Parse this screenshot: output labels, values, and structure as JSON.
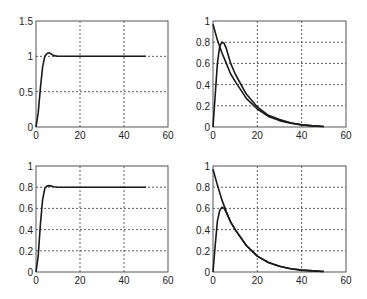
{
  "chart_data": [
    {
      "type": "line",
      "title": "",
      "xlabel": "",
      "ylabel": "",
      "xlim": [
        0,
        60
      ],
      "ylim": [
        0,
        1.5
      ],
      "xticks": [
        "0",
        "20",
        "40",
        "60"
      ],
      "yticks": [
        "0",
        "0.5",
        "1",
        "1.5"
      ],
      "grid": true,
      "series": [
        {
          "name": "response",
          "x": [
            0,
            1,
            2,
            3,
            4,
            5,
            6,
            7,
            8,
            10,
            15,
            20,
            30,
            40,
            50
          ],
          "values": [
            0,
            0.2,
            0.55,
            0.85,
            1.0,
            1.04,
            1.05,
            1.03,
            1.01,
            1.0,
            1.0,
            1.0,
            1.0,
            1.0,
            1.0
          ]
        }
      ]
    },
    {
      "type": "line",
      "title": "",
      "xlabel": "",
      "ylabel": "",
      "xlim": [
        0,
        60
      ],
      "ylim": [
        0,
        1
      ],
      "xticks": [
        "0",
        "20",
        "40",
        "60"
      ],
      "yticks": [
        "0",
        "0.2",
        "0.4",
        "0.6",
        "0.8",
        "1"
      ],
      "grid": true,
      "series": [
        {
          "name": "decay",
          "x": [
            0,
            2,
            4,
            6,
            8,
            10,
            15,
            20,
            25,
            30,
            35,
            40,
            45,
            50
          ],
          "values": [
            0.97,
            0.82,
            0.7,
            0.6,
            0.5,
            0.43,
            0.27,
            0.17,
            0.1,
            0.06,
            0.035,
            0.02,
            0.01,
            0.005
          ]
        },
        {
          "name": "rise-decay",
          "x": [
            0,
            1,
            2,
            3,
            4,
            5,
            6,
            8,
            10,
            15,
            20,
            25,
            30,
            35,
            40,
            45,
            50
          ],
          "values": [
            0,
            0.3,
            0.6,
            0.76,
            0.8,
            0.79,
            0.74,
            0.6,
            0.5,
            0.31,
            0.19,
            0.11,
            0.07,
            0.04,
            0.02,
            0.01,
            0.005
          ]
        }
      ]
    },
    {
      "type": "line",
      "title": "",
      "xlabel": "",
      "ylabel": "",
      "xlim": [
        0,
        60
      ],
      "ylim": [
        0,
        1
      ],
      "xticks": [
        "0",
        "20",
        "40",
        "60"
      ],
      "yticks": [
        "0",
        "0.2",
        "0.4",
        "0.6",
        "0.8",
        "1"
      ],
      "grid": true,
      "series": [
        {
          "name": "response",
          "x": [
            0,
            1,
            2,
            3,
            4,
            5,
            6,
            7,
            8,
            10,
            15,
            20,
            30,
            40,
            50
          ],
          "values": [
            0,
            0.15,
            0.45,
            0.68,
            0.79,
            0.81,
            0.815,
            0.81,
            0.805,
            0.8,
            0.8,
            0.8,
            0.8,
            0.8,
            0.8
          ]
        }
      ]
    },
    {
      "type": "line",
      "title": "",
      "xlabel": "",
      "ylabel": "",
      "xlim": [
        0,
        60
      ],
      "ylim": [
        0,
        1
      ],
      "xticks": [
        "0",
        "20",
        "40",
        "60"
      ],
      "yticks": [
        "0",
        "0.2",
        "0.4",
        "0.6",
        "0.8",
        "1"
      ],
      "grid": true,
      "series": [
        {
          "name": "decay",
          "x": [
            0,
            2,
            4,
            6,
            8,
            10,
            15,
            20,
            25,
            30,
            35,
            40,
            45,
            50
          ],
          "values": [
            0.97,
            0.82,
            0.68,
            0.57,
            0.47,
            0.4,
            0.25,
            0.15,
            0.09,
            0.055,
            0.03,
            0.018,
            0.01,
            0.005
          ]
        },
        {
          "name": "rise-decay",
          "x": [
            0,
            1,
            2,
            3,
            4,
            5,
            6,
            8,
            10,
            15,
            20,
            25,
            30,
            35,
            40,
            45,
            50
          ],
          "values": [
            0,
            0.25,
            0.48,
            0.58,
            0.61,
            0.6,
            0.56,
            0.47,
            0.4,
            0.25,
            0.15,
            0.09,
            0.055,
            0.03,
            0.018,
            0.01,
            0.005
          ]
        }
      ]
    }
  ],
  "layout": {
    "axes": [
      {
        "x0": 36,
        "x1": 168,
        "y0": 127,
        "y1": 21
      },
      {
        "x0": 213,
        "x1": 346,
        "y0": 127,
        "y1": 21
      },
      {
        "x0": 36,
        "x1": 168,
        "y0": 272,
        "y1": 166
      },
      {
        "x0": 213,
        "x1": 346,
        "y0": 272,
        "y1": 166
      }
    ],
    "line_color": "#1a1a1a",
    "grid_color": "#333333",
    "axis_color": "#555555"
  }
}
